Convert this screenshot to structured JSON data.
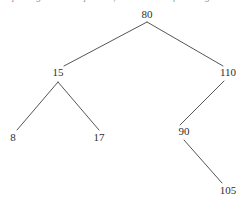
{
  "caption": {
    "text": "Repeating the above process, we obtain the following tree:"
  },
  "style": {
    "background_color": "#ffffff",
    "edge_color": "#555555",
    "label_color": "#2e2e2e",
    "edge_width": 1
  },
  "chart_data": {
    "type": "diagram",
    "diagram_kind": "binary-search-tree",
    "title": "",
    "nodes": [
      {
        "id": "n80",
        "label": "80",
        "x": 147,
        "y": 14,
        "depth": 0
      },
      {
        "id": "n15",
        "label": "15",
        "x": 58,
        "y": 72,
        "depth": 1
      },
      {
        "id": "n110",
        "label": "110",
        "x": 228,
        "y": 72,
        "depth": 1
      },
      {
        "id": "n8",
        "label": "8",
        "x": 13,
        "y": 137,
        "depth": 2
      },
      {
        "id": "n17",
        "label": "17",
        "x": 99,
        "y": 137,
        "depth": 2
      },
      {
        "id": "n90",
        "label": "90",
        "x": 184,
        "y": 131,
        "depth": 2
      },
      {
        "id": "n105",
        "label": "105",
        "x": 228,
        "y": 190,
        "depth": 3
      }
    ],
    "edges": [
      {
        "from": "n80",
        "to": "n15",
        "side": "left",
        "x1": 147,
        "y1": 22,
        "x2": 64,
        "y2": 66
      },
      {
        "from": "n80",
        "to": "n110",
        "side": "right",
        "x1": 147,
        "y1": 22,
        "x2": 223,
        "y2": 66
      },
      {
        "from": "n15",
        "to": "n8",
        "side": "left",
        "x1": 58,
        "y1": 82,
        "x2": 17,
        "y2": 130
      },
      {
        "from": "n15",
        "to": "n17",
        "side": "right",
        "x1": 58,
        "y1": 82,
        "x2": 99,
        "y2": 130
      },
      {
        "from": "n110",
        "to": "n90",
        "side": "left",
        "x1": 224,
        "y1": 81,
        "x2": 180,
        "y2": 125
      },
      {
        "from": "n90",
        "to": "n105",
        "side": "right",
        "x1": 184,
        "y1": 140,
        "x2": 222,
        "y2": 183
      }
    ],
    "values": [
      80,
      15,
      110,
      8,
      17,
      90,
      105
    ],
    "labels": [
      "80",
      "15",
      "110",
      "8",
      "17",
      "90",
      "105"
    ]
  }
}
